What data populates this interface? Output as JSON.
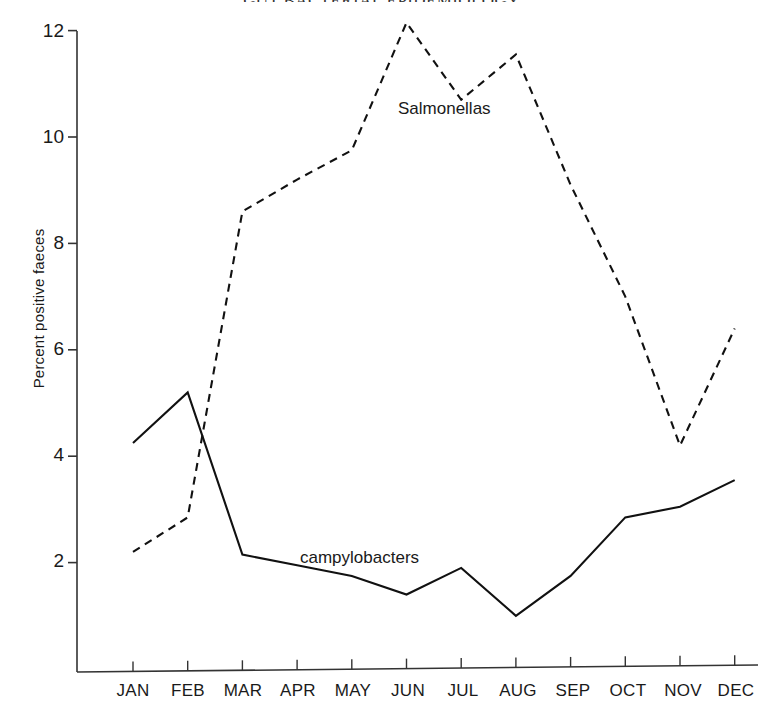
{
  "chart_data": {
    "type": "line",
    "title": "GUT BACTERIAL EPIDEMIOLOGY",
    "xlabel": "",
    "ylabel": "Percent positive faeces",
    "categories": [
      "JAN",
      "FEB",
      "MAR",
      "APR",
      "MAY",
      "JUN",
      "JUL",
      "AUG",
      "SEP",
      "OCT",
      "NOV",
      "DEC"
    ],
    "ylim": [
      0,
      12.4
    ],
    "yticks": [
      2,
      4,
      6,
      8,
      10,
      12
    ],
    "ytick_labels": [
      "2",
      "4",
      "6",
      "8",
      "10",
      "12"
    ],
    "grid": false,
    "legend_position": "inline-annotation",
    "series": [
      {
        "name": "Salmonellas",
        "style": "dashed",
        "color": "#111111",
        "values": [
          2.2,
          2.85,
          8.6,
          9.2,
          9.75,
          12.15,
          10.7,
          11.55,
          9.1,
          7.0,
          4.2,
          6.4
        ]
      },
      {
        "name": "campylobacters",
        "style": "solid",
        "color": "#111111",
        "values": [
          4.25,
          5.2,
          2.15,
          1.95,
          1.75,
          1.4,
          1.9,
          1.0,
          1.75,
          2.85,
          3.05,
          3.55
        ]
      }
    ],
    "annotations": [
      {
        "text": "Salmonellas",
        "x_month": "JUL",
        "y_value": 10.2
      },
      {
        "text": "campylobacters",
        "x_month": "MAY",
        "y_value": 2.35
      }
    ]
  },
  "axes": {
    "y_axis_name": "y-axis",
    "x_axis_name": "x-axis"
  }
}
